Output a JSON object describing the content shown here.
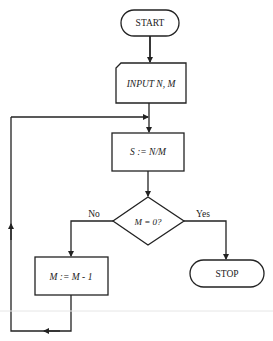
{
  "flowchart": {
    "nodes": {
      "start": {
        "label": "START",
        "shape": "terminal"
      },
      "input": {
        "label": "INPUT N, M",
        "shape": "input"
      },
      "divide": {
        "label": "S := N/M",
        "shape": "process"
      },
      "decision": {
        "label": "M = 0?",
        "shape": "decision"
      },
      "decrement": {
        "label": "M := M - 1",
        "shape": "process"
      },
      "stop": {
        "label": "STOP",
        "shape": "terminal"
      }
    },
    "edges": {
      "no_label": "No",
      "yes_label": "Yes"
    },
    "colors": {
      "stroke": "#222222",
      "background": "#ffffff",
      "divider": "#e6e6e6"
    }
  }
}
